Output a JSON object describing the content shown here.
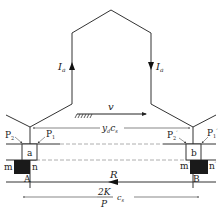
{
  "diagram": {
    "type": "electric-machine-coil-schematic",
    "colors": {
      "line": "#333333",
      "dashed": "#888888",
      "pole": "#1a1a1a",
      "background": "#ffffff"
    },
    "labels": {
      "current_left": "I",
      "current_left_sub": "a",
      "current_right": "I",
      "current_right_sub": "a",
      "velocity": "v",
      "pitch_label": "y",
      "pitch_label_sub": "d",
      "pitch_label_c": "c",
      "pitch_label_c_sub": "s",
      "p2": "P",
      "p2_sub": "2",
      "p1": "P",
      "p1_sub": "1",
      "p2_prime": "P",
      "p2_prime_sub": "2",
      "p2_prime_mark": "′",
      "p1_prime": "P",
      "p1_prime_sub": "1",
      "p1_prime_mark": "′",
      "slot_a": "a",
      "slot_b": "b",
      "m_left": "m",
      "n_left": "n",
      "m_right": "m",
      "m_right_mark": "′",
      "n_right": "n",
      "n_right_mark": "′",
      "point_a": "A",
      "point_b": "B",
      "force": "R",
      "frac_num": "2K",
      "frac_den": "P",
      "frac_c": "c",
      "frac_c_sub": "s"
    }
  }
}
